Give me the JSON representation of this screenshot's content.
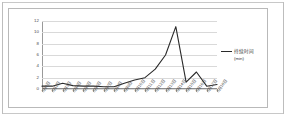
{
  "chart_data": {
    "type": "line",
    "title": "",
    "xlabel": "",
    "ylabel": "",
    "ylim": [
      0,
      12
    ],
    "yticks": [
      0,
      2,
      4,
      6,
      8,
      10,
      12
    ],
    "grid": true,
    "legend_position": "right",
    "legend": [
      "持续时间"
    ],
    "unit_label": "(min)",
    "categories": [
      "3月1日",
      "3月2日",
      "3月3日",
      "3月4日",
      "3月5日",
      "3月6日",
      "3月7日",
      "3月8日",
      "3月9日",
      "3月10日",
      "3月11日",
      "3月12日",
      "3月13日",
      "3月14日",
      "3月15日",
      "3月16日",
      "3月17日",
      "3月18日"
    ],
    "series": [
      {
        "name": "持续时间",
        "unit": "min",
        "color": "#2a2a2a",
        "values": [
          0.5,
          0.5,
          1.0,
          0.6,
          0.5,
          0.5,
          0.4,
          0.4,
          1.0,
          1.6,
          2.0,
          3.5,
          6.0,
          11.0,
          1.2,
          3.0,
          0.5,
          0.8
        ]
      }
    ]
  },
  "legend": {
    "series_label": "持续时间",
    "unit": "(min)"
  }
}
